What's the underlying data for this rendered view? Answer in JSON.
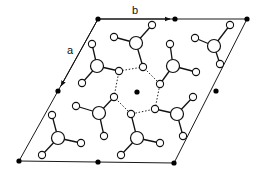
{
  "diagram": {
    "type": "crystal-structure-unit-cell",
    "axes": [
      {
        "label": "b",
        "from": [
          98,
          19
        ],
        "to": [
          170,
          19
        ],
        "label_pos": [
          135,
          14
        ]
      },
      {
        "label": "a",
        "from": [
          98,
          19
        ],
        "to": [
          61,
          86
        ],
        "label_pos": [
          70,
          54
        ]
      }
    ],
    "cell": {
      "corners": [
        [
          98,
          19
        ],
        [
          247,
          19
        ],
        [
          174,
          163
        ],
        [
          19,
          161
        ]
      ]
    },
    "lattice_points": [
      [
        98,
        19
      ],
      [
        175,
        19
      ],
      [
        247,
        19
      ],
      [
        58,
        91
      ],
      [
        137,
        92
      ],
      [
        216,
        91
      ],
      [
        19,
        161
      ],
      [
        98,
        162
      ],
      [
        174,
        163
      ]
    ],
    "molecules": [
      {
        "center": [
          97,
          66
        ],
        "h": [
          [
            92,
            44
          ],
          [
            119,
            71
          ],
          [
            82,
            83
          ]
        ]
      },
      {
        "center": [
          136,
          43
        ],
        "h": [
          [
            114,
            37
          ],
          [
            152,
            25
          ],
          [
            143,
            67
          ]
        ]
      },
      {
        "center": [
          173,
          66
        ],
        "h": [
          [
            170,
            44
          ],
          [
            196,
            72
          ],
          [
            160,
            84
          ]
        ]
      },
      {
        "center": [
          214,
          46
        ],
        "h": [
          [
            195,
            38
          ],
          [
            230,
            25
          ],
          [
            220,
            64
          ]
        ]
      },
      {
        "center": [
          58,
          138
        ],
        "h": [
          [
            52,
            115
          ],
          [
            81,
            143
          ],
          [
            42,
            155
          ]
        ]
      },
      {
        "center": [
          99,
          113
        ],
        "h": [
          [
            76,
            106
          ],
          [
            114,
            97
          ],
          [
            104,
            136
          ]
        ]
      },
      {
        "center": [
          177,
          114
        ],
        "h": [
          [
            155,
            109
          ],
          [
            193,
            97
          ],
          [
            183,
            136
          ]
        ]
      },
      {
        "center": [
          137,
          138
        ],
        "h": [
          [
            131,
            114
          ],
          [
            160,
            143
          ],
          [
            121,
            155
          ]
        ]
      }
    ],
    "hbond_ring": [
      [
        119,
        71
      ],
      [
        143,
        67
      ],
      [
        160,
        84
      ],
      [
        155,
        109
      ],
      [
        131,
        114
      ],
      [
        114,
        97
      ]
    ]
  }
}
